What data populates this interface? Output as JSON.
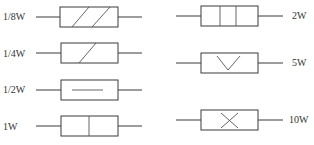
{
  "diagram": {
    "title": "",
    "colors": {
      "line": "#3a3a3a",
      "text": "#333333",
      "background": "#ffffff"
    },
    "symbols": [
      {
        "id": "r-1-8w",
        "label": "1/8W",
        "marking": "two-diagonal-slashes"
      },
      {
        "id": "r-1-4w",
        "label": "1/4W",
        "marking": "one-diagonal-slash"
      },
      {
        "id": "r-1-2w",
        "label": "1/2W",
        "marking": "horizontal-line"
      },
      {
        "id": "r-1w",
        "label": "1W",
        "marking": "one-vertical-line"
      },
      {
        "id": "r-2w",
        "label": "2W",
        "marking": "two-vertical-lines"
      },
      {
        "id": "r-5w",
        "label": "5W",
        "marking": "v-shape"
      },
      {
        "id": "r-10w",
        "label": "10W",
        "marking": "x-cross"
      }
    ]
  }
}
